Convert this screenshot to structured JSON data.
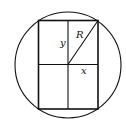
{
  "diagram": {
    "labels": {
      "radius": "R",
      "half_height": "y",
      "half_width": "x"
    },
    "colors": {
      "stroke": "#111111",
      "background": "#ffffff"
    }
  }
}
